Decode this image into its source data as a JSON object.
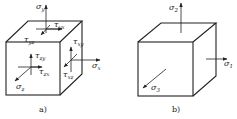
{
  "figure": {
    "panel_a": {
      "caption": "a)",
      "labels": {
        "sigma_y": {
          "sym": "σ",
          "sub": "y"
        },
        "tau_yx": {
          "sym": "τ",
          "sub": "yx"
        },
        "tau_yz": {
          "sym": "τ",
          "sub": "yz"
        },
        "tau_xy": {
          "sym": "τ",
          "sub": "xy"
        },
        "sigma_x": {
          "sym": "σ",
          "sub": "x"
        },
        "tau_xz": {
          "sym": "τ",
          "sub": "xz"
        },
        "tau_zy": {
          "sym": "τ",
          "sub": "zy"
        },
        "tau_zx": {
          "sym": "τ",
          "sub": "zx"
        },
        "sigma_z": {
          "sym": "σ",
          "sub": "z"
        }
      }
    },
    "panel_b": {
      "caption": "b)",
      "labels": {
        "sigma_2": {
          "sym": "σ",
          "sub": "2"
        },
        "sigma_1": {
          "sym": "σ",
          "sub": "1"
        },
        "sigma_3": {
          "sym": "σ",
          "sub": "3"
        }
      }
    },
    "colors": {
      "line": "#222222",
      "background": "#ffffff"
    }
  }
}
